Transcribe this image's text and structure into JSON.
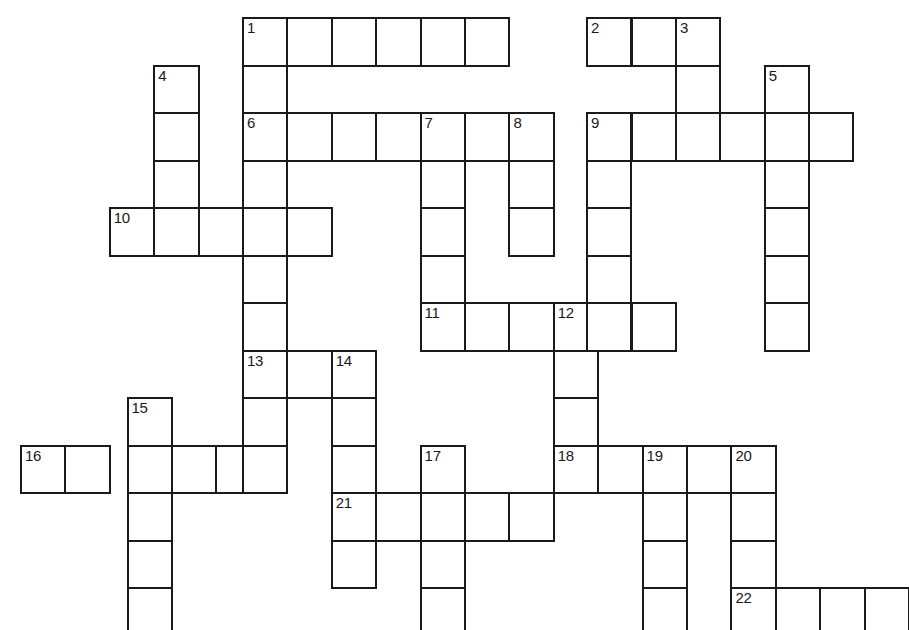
{
  "puzzle": {
    "title": "Crossword Puzzle Grid",
    "background_color": "#ffffff",
    "cell_fill_color": "#ffffff",
    "cell_border_color": "#1a1a1a",
    "number_color": "#1a1a1a",
    "cell_width": 44.4,
    "cell_height": 47.5,
    "origin_x": 20,
    "origin_y": 17,
    "columns": 20,
    "rows": 13,
    "numbered_clues": [
      1,
      2,
      3,
      4,
      5,
      6,
      7,
      8,
      9,
      10,
      11,
      12,
      13,
      14,
      15,
      16,
      17,
      18,
      19,
      20,
      21,
      22
    ],
    "cells": [
      {
        "col": 5,
        "row": 0,
        "number": "1"
      },
      {
        "col": 6,
        "row": 0,
        "number": ""
      },
      {
        "col": 7,
        "row": 0,
        "number": ""
      },
      {
        "col": 8,
        "row": 0,
        "number": ""
      },
      {
        "col": 9,
        "row": 0,
        "number": ""
      },
      {
        "col": 10,
        "row": 0,
        "number": ""
      },
      {
        "col": 12.75,
        "row": 0,
        "number": "2"
      },
      {
        "col": 13.75,
        "row": 0,
        "number": ""
      },
      {
        "col": 14.75,
        "row": 0,
        "number": "3"
      },
      {
        "col": 3,
        "row": 1,
        "number": "4"
      },
      {
        "col": 5,
        "row": 1,
        "number": ""
      },
      {
        "col": 14.75,
        "row": 1,
        "number": ""
      },
      {
        "col": 16.75,
        "row": 1,
        "number": "5"
      },
      {
        "col": 3,
        "row": 2,
        "number": ""
      },
      {
        "col": 5,
        "row": 2,
        "number": "6"
      },
      {
        "col": 6,
        "row": 2,
        "number": ""
      },
      {
        "col": 7,
        "row": 2,
        "number": ""
      },
      {
        "col": 8,
        "row": 2,
        "number": ""
      },
      {
        "col": 9,
        "row": 2,
        "number": "7"
      },
      {
        "col": 10,
        "row": 2,
        "number": ""
      },
      {
        "col": 11,
        "row": 2,
        "number": "8"
      },
      {
        "col": 12.75,
        "row": 2,
        "number": "9"
      },
      {
        "col": 13.75,
        "row": 2,
        "number": ""
      },
      {
        "col": 14.75,
        "row": 2,
        "number": ""
      },
      {
        "col": 15.75,
        "row": 2,
        "number": ""
      },
      {
        "col": 16.75,
        "row": 2,
        "number": ""
      },
      {
        "col": 17.75,
        "row": 2,
        "number": ""
      },
      {
        "col": 3,
        "row": 3,
        "number": ""
      },
      {
        "col": 5,
        "row": 3,
        "number": ""
      },
      {
        "col": 9,
        "row": 3,
        "number": ""
      },
      {
        "col": 11,
        "row": 3,
        "number": ""
      },
      {
        "col": 12.75,
        "row": 3,
        "number": ""
      },
      {
        "col": 16.75,
        "row": 3,
        "number": ""
      },
      {
        "col": 2,
        "row": 4,
        "number": "10"
      },
      {
        "col": 3,
        "row": 4,
        "number": ""
      },
      {
        "col": 4,
        "row": 4,
        "number": ""
      },
      {
        "col": 5,
        "row": 4,
        "number": ""
      },
      {
        "col": 6,
        "row": 4,
        "number": ""
      },
      {
        "col": 9,
        "row": 4,
        "number": ""
      },
      {
        "col": 11,
        "row": 4,
        "number": ""
      },
      {
        "col": 12.75,
        "row": 4,
        "number": ""
      },
      {
        "col": 16.75,
        "row": 4,
        "number": ""
      },
      {
        "col": 5,
        "row": 5,
        "number": ""
      },
      {
        "col": 9,
        "row": 5,
        "number": ""
      },
      {
        "col": 12.75,
        "row": 5,
        "number": ""
      },
      {
        "col": 16.75,
        "row": 5,
        "number": ""
      },
      {
        "col": 5,
        "row": 6,
        "number": ""
      },
      {
        "col": 9,
        "row": 6,
        "number": "11"
      },
      {
        "col": 10,
        "row": 6,
        "number": ""
      },
      {
        "col": 11,
        "row": 6,
        "number": ""
      },
      {
        "col": 12,
        "row": 6,
        "number": "12"
      },
      {
        "col": 12.75,
        "row": 6,
        "number": ""
      },
      {
        "col": 13.75,
        "row": 6,
        "number": ""
      },
      {
        "col": 16.75,
        "row": 6,
        "number": ""
      },
      {
        "col": 5,
        "row": 7,
        "number": "13"
      },
      {
        "col": 6,
        "row": 7,
        "number": ""
      },
      {
        "col": 7,
        "row": 7,
        "number": "14"
      },
      {
        "col": 12,
        "row": 7,
        "number": ""
      },
      {
        "col": 2.4,
        "row": 8,
        "number": "15"
      },
      {
        "col": 5,
        "row": 8,
        "number": ""
      },
      {
        "col": 7,
        "row": 8,
        "number": ""
      },
      {
        "col": 12,
        "row": 8,
        "number": ""
      },
      {
        "col": 0,
        "row": 9,
        "number": "16"
      },
      {
        "col": 1,
        "row": 9,
        "number": ""
      },
      {
        "col": 2.4,
        "row": 9,
        "number": ""
      },
      {
        "col": 3.4,
        "row": 9,
        "number": ""
      },
      {
        "col": 4.4,
        "row": 9,
        "number": ""
      },
      {
        "col": 5,
        "row": 9,
        "number": ""
      },
      {
        "col": 7,
        "row": 9,
        "number": ""
      },
      {
        "col": 9,
        "row": 9,
        "number": "17"
      },
      {
        "col": 12,
        "row": 9,
        "number": "18"
      },
      {
        "col": 13,
        "row": 9,
        "number": ""
      },
      {
        "col": 14,
        "row": 9,
        "number": "19"
      },
      {
        "col": 15,
        "row": 9,
        "number": ""
      },
      {
        "col": 16,
        "row": 9,
        "number": "20"
      },
      {
        "col": 2.4,
        "row": 10,
        "number": ""
      },
      {
        "col": 7,
        "row": 10,
        "number": "21"
      },
      {
        "col": 8,
        "row": 10,
        "number": ""
      },
      {
        "col": 9,
        "row": 10,
        "number": ""
      },
      {
        "col": 10,
        "row": 10,
        "number": ""
      },
      {
        "col": 11,
        "row": 10,
        "number": ""
      },
      {
        "col": 14,
        "row": 10,
        "number": ""
      },
      {
        "col": 16,
        "row": 10,
        "number": ""
      },
      {
        "col": 2.4,
        "row": 11,
        "number": ""
      },
      {
        "col": 7,
        "row": 11,
        "number": ""
      },
      {
        "col": 9,
        "row": 11,
        "number": ""
      },
      {
        "col": 14,
        "row": 11,
        "number": ""
      },
      {
        "col": 16,
        "row": 11,
        "number": ""
      },
      {
        "col": 2.4,
        "row": 12,
        "number": ""
      },
      {
        "col": 9,
        "row": 12,
        "number": ""
      },
      {
        "col": 14,
        "row": 12,
        "number": ""
      },
      {
        "col": 16,
        "row": 12,
        "number": "22"
      },
      {
        "col": 17,
        "row": 12,
        "number": ""
      },
      {
        "col": 18,
        "row": 12,
        "number": ""
      },
      {
        "col": 19,
        "row": 12,
        "number": ""
      }
    ]
  }
}
